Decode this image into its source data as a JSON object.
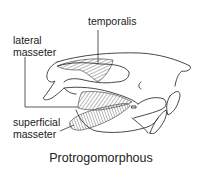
{
  "diagram": {
    "caption": "Protrogomorphous",
    "labels": {
      "temporalis": "temporalis",
      "lateral_masseter_line1": "lateral",
      "lateral_masseter_line2": "masseter",
      "superficial_masseter_line1": "superficial",
      "superficial_masseter_line2": "masseter"
    },
    "colors": {
      "line": "#333333",
      "background": "#ffffff"
    }
  }
}
